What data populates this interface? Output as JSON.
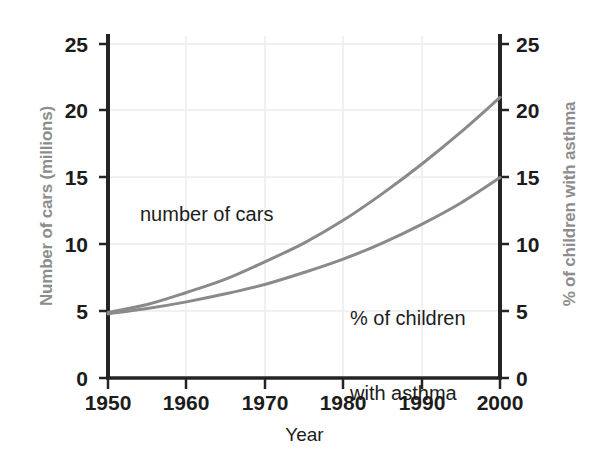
{
  "chart_data": {
    "type": "line",
    "title": "",
    "xlabel": "Year",
    "ylabel": "Number of cars (millions)",
    "ylabel_right": "% of children with asthma",
    "x": [
      1950,
      1955,
      1960,
      1965,
      1970,
      1975,
      1980,
      1985,
      1990,
      1995,
      2000
    ],
    "xlim": [
      1950,
      2000
    ],
    "ylim": [
      0,
      25
    ],
    "ylim_right": [
      0,
      25
    ],
    "xticks": [
      "1950",
      "1960",
      "1970",
      "1980",
      "1990",
      "2000"
    ],
    "yticks_left": [
      "0",
      "5",
      "10",
      "15",
      "20",
      "25"
    ],
    "yticks_right": [
      "0",
      "5",
      "10",
      "15",
      "20",
      "25"
    ],
    "grid": true,
    "legend": "none",
    "series": [
      {
        "name": "number of cars",
        "axis": "left",
        "units": "millions",
        "color": "#8a8a8a",
        "values": [
          4.9,
          5.5,
          6.4,
          7.4,
          8.7,
          10.1,
          11.8,
          13.8,
          16.0,
          18.4,
          21.0
        ]
      },
      {
        "name": "% of children with asthma",
        "axis": "right",
        "units": "%",
        "color": "#8a8a8a",
        "values": [
          4.8,
          5.2,
          5.7,
          6.3,
          7.0,
          7.9,
          8.9,
          10.1,
          11.5,
          13.1,
          15.0
        ]
      }
    ],
    "annotations": [
      {
        "id": "cars",
        "text": "number of cars"
      },
      {
        "id": "asthma",
        "line1": "% of children",
        "line2": "with asthma"
      }
    ]
  },
  "axes": {
    "left_title": "Number of cars (millions)",
    "right_title": "% of children with asthma",
    "x_title": "Year",
    "left_ticks": [
      "25",
      "20",
      "15",
      "10",
      "5",
      "0"
    ],
    "right_ticks": [
      "25",
      "20",
      "15",
      "10",
      "5",
      "0"
    ],
    "x_ticks": [
      "1950",
      "1960",
      "1970",
      "1980",
      "1990",
      "2000"
    ]
  },
  "annotations": {
    "cars_label": "number of cars",
    "asthma_label_line1": "% of children",
    "asthma_label_line2": "with asthma"
  },
  "colors": {
    "axis_title_gray": "#8d8d8d",
    "curve_gray": "#8a8a8a",
    "text_black": "#1c1c1c",
    "grid": "#ececec",
    "spine": "#242424"
  }
}
